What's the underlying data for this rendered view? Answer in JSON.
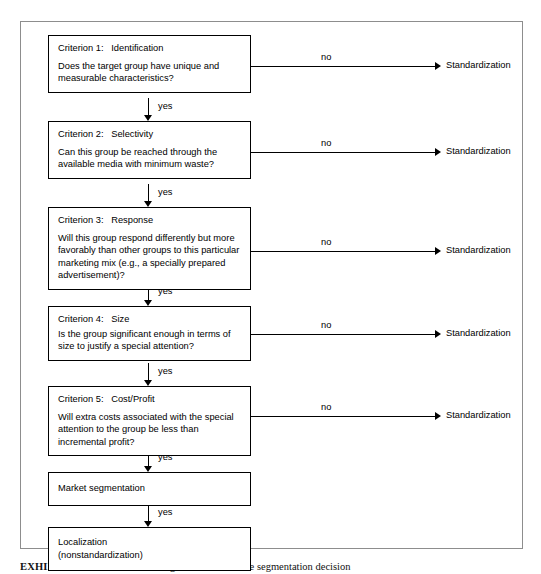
{
  "exhibit": {
    "caption_label": "EXHIBIT 15-10",
    "caption_text": "A decision making framework for the segmentation decision"
  },
  "flow": {
    "yes_label": "yes",
    "no_label": "no",
    "no_endpoint_label": "Standardization",
    "nodes": [
      {
        "id": "criterion-1",
        "title": "Criterion 1:   Identification",
        "question": "Does the target group have unique and measurable characteristics?",
        "no_target": "Standardization",
        "yes_label": "yes",
        "no_label": "no"
      },
      {
        "id": "criterion-2",
        "title": "Criterion 2:   Selectivity",
        "question": "Can this group be reached through the available media with minimum waste?",
        "no_target": "Standardization",
        "yes_label": "yes",
        "no_label": "no"
      },
      {
        "id": "criterion-3",
        "title": "Criterion 3:   Response",
        "question": "Will this group respond differently but more favorably than other groups to this particular marketing mix (e.g., a specially prepared advertisement)?",
        "no_target": "Standardization",
        "yes_label": "yes",
        "no_label": "no"
      },
      {
        "id": "criterion-4",
        "title": "Criterion 4:   Size",
        "question": "Is the group significant enough in terms of size to justify a special attention?",
        "no_target": "Standardization",
        "yes_label": "yes",
        "no_label": "no"
      },
      {
        "id": "criterion-5",
        "title": "Criterion 5:   Cost/Profit",
        "question": "Will extra costs associated with the special attention to the group be less than incremental profit?",
        "no_target": "Standardization",
        "yes_label": "yes",
        "no_label": "no"
      },
      {
        "id": "market-segmentation",
        "title": "Market segmentation",
        "question": "",
        "no_target": "",
        "yes_label": "yes",
        "no_label": ""
      },
      {
        "id": "localization",
        "title": "Localization",
        "question": "(nonstandardization)",
        "no_target": "",
        "yes_label": "",
        "no_label": ""
      }
    ]
  },
  "colors": {
    "line": "#000000",
    "frame": "#8d8d8d",
    "background": "#ffffff"
  }
}
